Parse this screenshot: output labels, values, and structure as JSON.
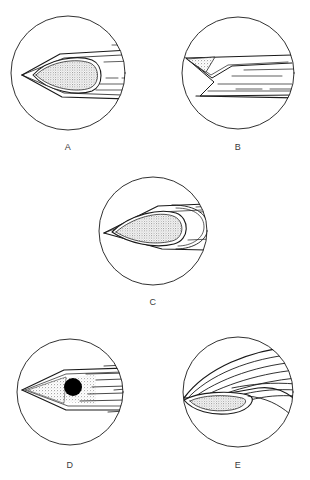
{
  "figure": {
    "kind": "scientific-line-drawing",
    "background_color": "#ffffff",
    "ink_color": "#1a1a1a",
    "stipple_fill_color": "#d9d9d9",
    "solid_fill_color": "#000000",
    "panel_count": 5,
    "caption_text": ""
  },
  "panels": [
    {
      "id": "A",
      "label": "A",
      "label_x": 68,
      "label_y": 148,
      "circle": {
        "cx": 68,
        "cy": 73,
        "r": 57
      },
      "description": "Lens-shaped stippled body with pointed left apex, double outline, horizontal streaming lines to the right",
      "shaded_region": "stippled-lens",
      "streak_count": 6
    },
    {
      "id": "B",
      "label": "B",
      "label_x": 238,
      "label_y": 148,
      "circle": {
        "cx": 238,
        "cy": 73,
        "r": 56
      },
      "description": "Narrow triangular stippled wedge at upper left with chevron outline and horizontal streaming lines",
      "shaded_region": "stippled-triangle",
      "streak_count": 7
    },
    {
      "id": "C",
      "label": "C",
      "label_x": 153,
      "label_y": 303,
      "circle": {
        "cx": 153,
        "cy": 231,
        "r": 54
      },
      "description": "Elongate stippled ovoid inside a pointed wedge, with a rounded trailing lobe and lines to the right",
      "shaded_region": "stippled-ovoid",
      "streak_count": 4
    },
    {
      "id": "D",
      "label": "D",
      "label_x": 70,
      "label_y": 466,
      "circle": {
        "cx": 70,
        "cy": 392,
        "r": 53
      },
      "description": "Sharp pointed wedge with faint stipple and a solid black circular spot, long horizontal streaming lines",
      "shaded_region": "stippled-wedge",
      "solid_spot": {
        "cx": 73,
        "cy": 387,
        "r": 9
      },
      "streak_count": 8
    },
    {
      "id": "E",
      "label": "E",
      "label_x": 238,
      "label_y": 466,
      "circle": {
        "cx": 238,
        "cy": 392,
        "r": 55
      },
      "description": "Sweeping curved bands rising to the upper right with a narrow stippled lens at lower left",
      "shaded_region": "stippled-narrow-lens",
      "streak_count": 9
    }
  ]
}
